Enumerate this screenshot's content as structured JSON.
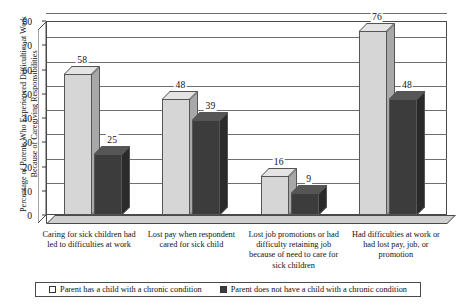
{
  "chart_data": {
    "type": "bar",
    "title": "",
    "xlabel": "",
    "ylabel": "Percentage of Parents Who Experienced Difficulties at Work Because of Caregiving Responsibilities",
    "ylim": [
      0,
      80
    ],
    "ytick_step": 10,
    "yticks": [
      0,
      10,
      20,
      30,
      40,
      50,
      60,
      70,
      80
    ],
    "grid": true,
    "legend_position": "bottom",
    "three_d": true,
    "categories": [
      "Caring for sick children had led to difficulties at work",
      "Lost pay when respondent cared for sick child",
      "Lost job promotions or had difficulty retaining job because of need to care for sick children",
      "Had difficulties at work or had lost pay, job, or promotion"
    ],
    "series": [
      {
        "name": "Parent has a child with a chronic condition",
        "color": "#d6d6d6",
        "values": [
          58,
          48,
          16,
          76
        ]
      },
      {
        "name": "Parent does not have a child with a chronic condition",
        "color": "#3c3c3c",
        "values": [
          25,
          39,
          9,
          48
        ]
      }
    ]
  },
  "legend": {
    "items": [
      {
        "label": "Parent has a child with a chronic condition",
        "swatch": "light"
      },
      {
        "label": "Parent does not have a child with a chronic condition",
        "swatch": "dark"
      }
    ]
  }
}
